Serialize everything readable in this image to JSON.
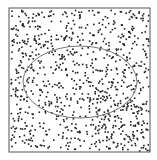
{
  "diagram": {
    "frame": {
      "x": 9,
      "y": 8,
      "width": 141,
      "height": 144,
      "stroke": "#555555"
    },
    "ellipse": {
      "cx": 80,
      "cy": 82,
      "rx": 57,
      "ry": 36,
      "stroke": "#777777"
    },
    "points": {
      "count": 900,
      "color": "#222222",
      "radius": 0.9,
      "seed": 7
    }
  }
}
